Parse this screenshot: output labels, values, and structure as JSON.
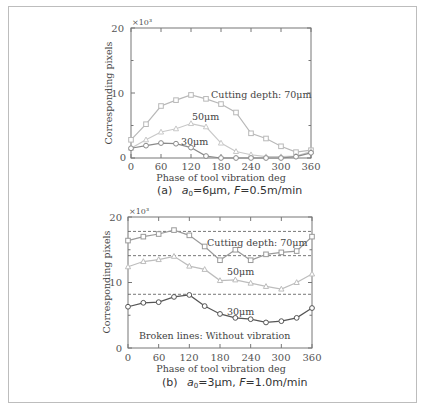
{
  "figure": {
    "panels": [
      {
        "caption_prefix": "(a)",
        "caption_a0": "a",
        "caption_sub": "0",
        "caption_rest1": "=6μm, ",
        "caption_F": "F",
        "caption_rest2": "=0.5m/min",
        "scale_label": "×10³",
        "ylabel": "Corresponding pixels",
        "xlabel": "Phase of tool vibration  deg",
        "yticks": [
          "0",
          "10",
          "20"
        ],
        "xticks": [
          "0",
          "60",
          "120",
          "180",
          "240",
          "300",
          "360"
        ],
        "annotations": {
          "d70": "Cutting depth: 70μm",
          "d50": "50μm",
          "d30": "30μm"
        }
      },
      {
        "caption_prefix": "(b)",
        "caption_a0": "a",
        "caption_sub": "0",
        "caption_rest1": "=3μm, ",
        "caption_F": "F",
        "caption_rest2": "=1.0m/min",
        "scale_label": "×10³",
        "ylabel": "Corresponding pixels",
        "xlabel": "Phase of tool vibration   deg",
        "yticks": [
          "0",
          "10",
          "20"
        ],
        "xticks": [
          "0",
          "60",
          "120",
          "180",
          "240",
          "300",
          "360"
        ],
        "annotations": {
          "d70": "Cutting depth: 70μm",
          "d50": "50μm",
          "d30": "30μm",
          "note": "Broken lines: Without vibration"
        }
      }
    ]
  },
  "chart_data": [
    {
      "type": "line",
      "title": "(a) a0=6μm, F=0.5m/min",
      "xlabel": "Phase of tool vibration deg",
      "ylabel": "Corresponding pixels (×10³)",
      "xlim": [
        0,
        360
      ],
      "ylim": [
        0,
        20
      ],
      "x": [
        0,
        30,
        60,
        90,
        120,
        150,
        180,
        210,
        240,
        270,
        300,
        330,
        360
      ],
      "series": [
        {
          "name": "Cutting depth: 70μm",
          "marker": "square",
          "color": "#b8b8b8",
          "values": [
            2.8,
            5.2,
            8.0,
            8.9,
            9.7,
            9.1,
            8.3,
            7.0,
            3.8,
            3.0,
            1.8,
            0.9,
            1.2
          ]
        },
        {
          "name": "50μm",
          "marker": "triangle",
          "color": "#c8c8c8",
          "values": [
            1.5,
            2.8,
            4.0,
            4.5,
            5.3,
            4.8,
            2.3,
            1.0,
            0.5,
            0.2,
            0.2,
            0.3,
            1.0
          ]
        },
        {
          "name": "30μm",
          "marker": "circle",
          "color": "#8a8a8a",
          "values": [
            1.5,
            1.9,
            2.3,
            2.2,
            1.6,
            0.3,
            0.0,
            0.0,
            0.0,
            0.0,
            0.0,
            0.2,
            0.8
          ]
        }
      ],
      "grid": false
    },
    {
      "type": "line",
      "title": "(b) a0=3μm, F=1.0m/min",
      "xlabel": "Phase of tool vibration deg",
      "ylabel": "Corresponding pixels (×10³)",
      "xlim": [
        0,
        360
      ],
      "ylim": [
        0,
        20
      ],
      "x": [
        0,
        30,
        60,
        90,
        120,
        150,
        180,
        210,
        240,
        270,
        300,
        330,
        360
      ],
      "series": [
        {
          "name": "Cutting depth: 70μm",
          "marker": "square",
          "color": "#9a9a9a",
          "values": [
            16.4,
            17.0,
            17.4,
            18.0,
            17.2,
            15.5,
            13.4,
            15.0,
            13.4,
            14.3,
            14.6,
            14.8,
            17.0
          ]
        },
        {
          "name": "50μm",
          "marker": "triangle",
          "color": "#bdbdbd",
          "values": [
            12.4,
            13.2,
            13.5,
            14.0,
            12.5,
            12.0,
            10.3,
            10.4,
            9.9,
            9.4,
            9.0,
            10.0,
            11.3
          ]
        },
        {
          "name": "30μm",
          "marker": "circle",
          "color": "#555555",
          "values": [
            6.3,
            6.9,
            7.0,
            7.8,
            8.1,
            6.4,
            5.2,
            4.6,
            4.4,
            3.9,
            4.1,
            4.6,
            6.1
          ]
        }
      ],
      "reference_lines": [
        {
          "name": "Without vibration 70μm",
          "style": "dashed",
          "value": 17.8
        },
        {
          "name": "Without vibration 50μm",
          "style": "dashed",
          "value": 14.1
        },
        {
          "name": "Without vibration 30μm",
          "style": "dashed",
          "value": 8.2
        }
      ],
      "annotation": "Broken lines: Without vibration",
      "grid": false
    }
  ]
}
